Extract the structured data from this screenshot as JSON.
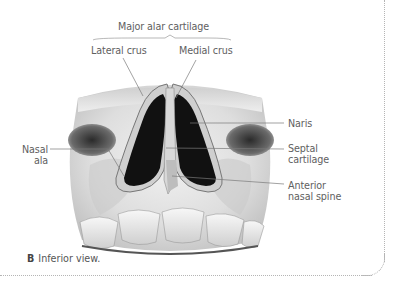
{
  "figure": {
    "group_label": "Major alar cartilage",
    "labels": {
      "lateral_crus": "Lateral crus",
      "medial_crus": "Medial crus",
      "nasal_ala_line1": "Nasal",
      "nasal_ala_line2": "ala",
      "naris": "Naris",
      "septal_cartilage_line1": "Septal",
      "septal_cartilage_line2": "cartilage",
      "anterior_nasal_spine_line1": "Anterior",
      "anterior_nasal_spine_line2": "nasal spine"
    },
    "caption": {
      "letter": "B",
      "text": "Inferior view."
    }
  }
}
